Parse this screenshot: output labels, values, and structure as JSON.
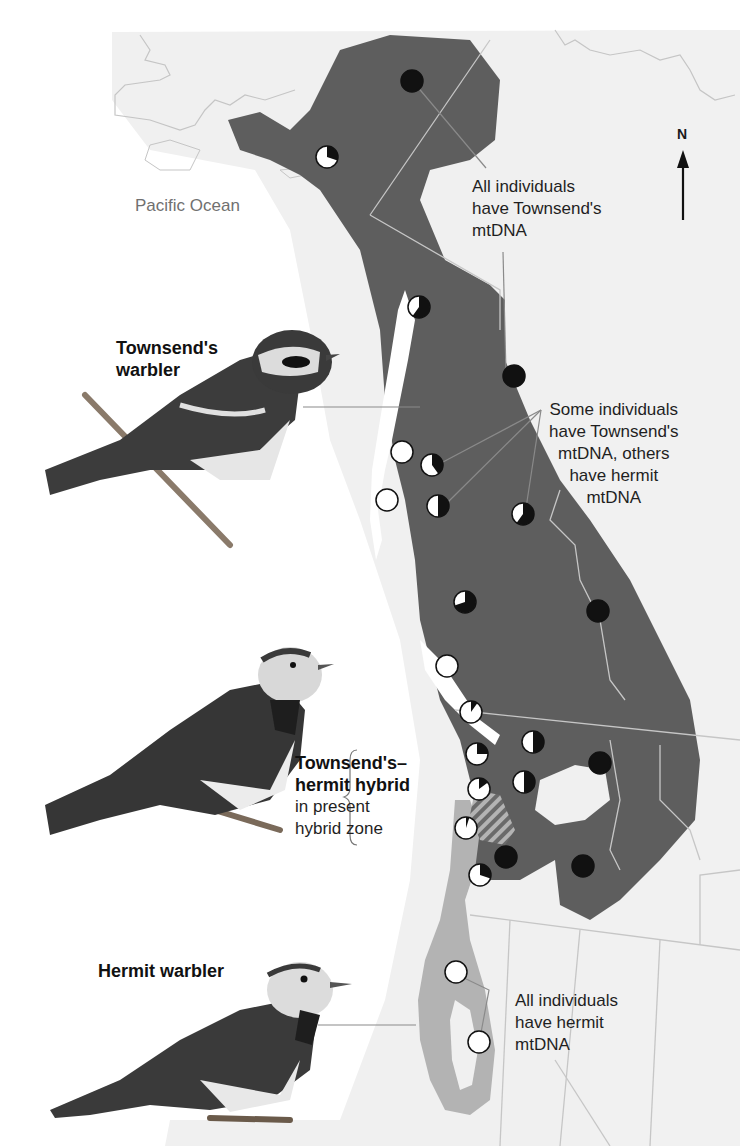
{
  "map": {
    "ocean_label": "Pacific Ocean",
    "north_label": "N",
    "colors": {
      "background": "#ffffff",
      "land": "#f0f0f0",
      "townsend_range": "#5e5e5e",
      "hermit_range": "#b3b3b3",
      "borders": "#c8c8c8",
      "townsend_mtdna": "#111111",
      "hermit_mtdna": "#ffffff"
    }
  },
  "annotations": {
    "all_townsend": [
      "All individuals",
      "have Townsend's",
      "mtDNA"
    ],
    "mixed": [
      "Some individuals",
      "have Townsend's",
      "mtDNA, others",
      "have hermit",
      "mtDNA"
    ],
    "all_hermit": [
      "All individuals",
      "have hermit",
      "mtDNA"
    ]
  },
  "birds": {
    "townsends": {
      "name_lines": [
        "Townsend's",
        "warbler"
      ]
    },
    "hybrid": {
      "name_bold_lines": [
        "Townsend's–",
        "hermit hybrid"
      ],
      "name_regular_lines": [
        "in present",
        "hybrid zone"
      ]
    },
    "hermit": {
      "name_lines": [
        "Hermit warbler"
      ]
    }
  },
  "chart_data": {
    "type": "map",
    "legend": [
      {
        "label": "Townsend's mtDNA",
        "color": "#111111"
      },
      {
        "label": "hermit mtDNA",
        "color": "#ffffff"
      }
    ],
    "sample_sites": [
      {
        "x": 412,
        "y": 81,
        "townsend_fraction": 1.0
      },
      {
        "x": 327,
        "y": 157,
        "townsend_fraction": 0.3
      },
      {
        "x": 419,
        "y": 307,
        "townsend_fraction": 0.6
      },
      {
        "x": 514,
        "y": 376,
        "townsend_fraction": 1.0
      },
      {
        "x": 402,
        "y": 452,
        "townsend_fraction": 0.0
      },
      {
        "x": 432,
        "y": 465,
        "townsend_fraction": 0.4
      },
      {
        "x": 387,
        "y": 500,
        "townsend_fraction": 0.0
      },
      {
        "x": 438,
        "y": 506,
        "townsend_fraction": 0.5
      },
      {
        "x": 523,
        "y": 514,
        "townsend_fraction": 0.6
      },
      {
        "x": 465,
        "y": 602,
        "townsend_fraction": 0.7
      },
      {
        "x": 598,
        "y": 611,
        "townsend_fraction": 1.0
      },
      {
        "x": 447,
        "y": 666,
        "townsend_fraction": 0.0
      },
      {
        "x": 471,
        "y": 712,
        "townsend_fraction": 0.1
      },
      {
        "x": 533,
        "y": 742,
        "townsend_fraction": 0.5
      },
      {
        "x": 477,
        "y": 754,
        "townsend_fraction": 0.25
      },
      {
        "x": 600,
        "y": 763,
        "townsend_fraction": 1.0
      },
      {
        "x": 479,
        "y": 789,
        "townsend_fraction": 0.15
      },
      {
        "x": 524,
        "y": 782,
        "townsend_fraction": 0.5
      },
      {
        "x": 466,
        "y": 828,
        "townsend_fraction": 0.05
      },
      {
        "x": 506,
        "y": 857,
        "townsend_fraction": 1.0
      },
      {
        "x": 583,
        "y": 866,
        "townsend_fraction": 1.0
      },
      {
        "x": 480,
        "y": 875,
        "townsend_fraction": 0.3
      },
      {
        "x": 456,
        "y": 972,
        "townsend_fraction": 0.0
      },
      {
        "x": 479,
        "y": 1042,
        "townsend_fraction": 0.0
      }
    ]
  }
}
